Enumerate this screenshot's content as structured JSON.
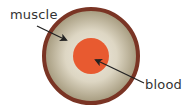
{
  "diagram": {
    "type": "cross-section",
    "labels": {
      "muscle": "muscle",
      "blood": "blood"
    },
    "colors": {
      "outer_ring": "#7a3424",
      "muscle_fill_center": "#ede8dc",
      "muscle_fill_edge": "#a89e82",
      "blood": "#e85a30",
      "arrow": "#222222",
      "text": "#333333"
    },
    "shapes": {
      "outer_circle": {
        "cx": 91,
        "cy": 56,
        "r": 47
      },
      "blood_circle": {
        "cx": 91,
        "cy": 56,
        "r": 18
      }
    },
    "arrows": [
      {
        "label": "muscle",
        "from": [
          37,
          26
        ],
        "to": [
          66,
          40
        ]
      },
      {
        "label": "blood",
        "from": [
          144,
          83
        ],
        "to": [
          96,
          60
        ]
      }
    ]
  }
}
